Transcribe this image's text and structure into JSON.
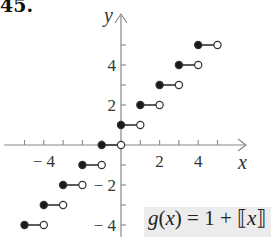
{
  "problem_number": "45.",
  "formula": {
    "lhs_func": "g",
    "lhs_var": "x",
    "rhs": "= 1 + ",
    "bracket_open": "⟦",
    "bracket_var": "x",
    "bracket_close": "⟧",
    "text": "g(x) = 1 + [[x]]"
  },
  "colors": {
    "axis": "#888888",
    "segment": "#333333",
    "filled_dot": "#1a1a1a",
    "open_dot_fill": "#ffffff",
    "formula_bg": "#ececec"
  },
  "chart_data": {
    "type": "step",
    "xlabel": "x",
    "ylabel": "y",
    "xlim": [
      -6,
      6
    ],
    "ylim": [
      -5,
      6
    ],
    "x_tick_labels": [
      "-4",
      "2",
      "4"
    ],
    "y_tick_labels": [
      "4",
      "2",
      "-2",
      "-4"
    ],
    "x_ticks": [
      -5,
      -4,
      -3,
      -2,
      -1,
      1,
      2,
      3,
      4,
      5
    ],
    "y_ticks": [
      -4,
      -3,
      -2,
      -1,
      1,
      2,
      3,
      4,
      5
    ],
    "grid": false,
    "segments": [
      {
        "x_start": -5,
        "x_end": -4,
        "y": -4,
        "start_closed": true,
        "end_closed": false
      },
      {
        "x_start": -4,
        "x_end": -3,
        "y": -3,
        "start_closed": true,
        "end_closed": false
      },
      {
        "x_start": -3,
        "x_end": -2,
        "y": -2,
        "start_closed": true,
        "end_closed": false
      },
      {
        "x_start": -2,
        "x_end": -1,
        "y": -1,
        "start_closed": true,
        "end_closed": false
      },
      {
        "x_start": -1,
        "x_end": 0,
        "y": 0,
        "start_closed": true,
        "end_closed": false
      },
      {
        "x_start": 0,
        "x_end": 1,
        "y": 1,
        "start_closed": true,
        "end_closed": false
      },
      {
        "x_start": 1,
        "x_end": 2,
        "y": 2,
        "start_closed": true,
        "end_closed": false
      },
      {
        "x_start": 2,
        "x_end": 3,
        "y": 3,
        "start_closed": true,
        "end_closed": false
      },
      {
        "x_start": 3,
        "x_end": 4,
        "y": 4,
        "start_closed": true,
        "end_closed": false
      },
      {
        "x_start": 4,
        "x_end": 5,
        "y": 5,
        "start_closed": true,
        "end_closed": false
      }
    ]
  }
}
